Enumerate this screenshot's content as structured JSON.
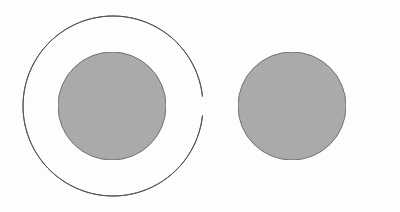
{
  "diagram": {
    "background": "#fdfdfd",
    "stroke_color": "#555555",
    "fill_color": "#a9a9a9",
    "shapes": [
      {
        "name": "left",
        "outer": {
          "cx": 113,
          "cy": 106,
          "r": 90
        },
        "inner": {
          "cx": 112,
          "cy": 106,
          "r": 54
        }
      },
      {
        "name": "right",
        "outer": {
          "cx": 292,
          "cy": 106,
          "r": 90
        },
        "inner": {
          "cx": 292,
          "cy": 106,
          "r": 54
        }
      }
    ]
  }
}
